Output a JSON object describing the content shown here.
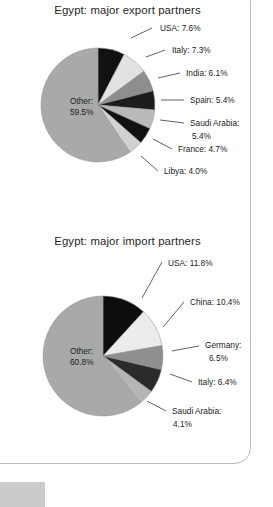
{
  "page": {
    "background_color": "#ffffff",
    "border_color": "#b9bcbe",
    "corner_block_color": "#c9cbcc"
  },
  "chart_data": [
    {
      "id": "export",
      "type": "pie",
      "title": "Egypt: major export partners",
      "xlabel": "",
      "ylabel": "",
      "legend": "callout-labels",
      "grid": false,
      "start_angle_deg": 0,
      "direction": "clockwise",
      "center": {
        "x": 98,
        "y": 105
      },
      "radius": 57,
      "categories": [
        "USA",
        "Italy",
        "India",
        "Spain",
        "Saudi Arabia",
        "France",
        "Libya",
        "Other"
      ],
      "values": [
        7.6,
        7.3,
        6.1,
        5.4,
        5.4,
        4.7,
        4.0,
        59.5
      ],
      "colors": [
        "#111111",
        "#e2e2e0",
        "#8d8f8f",
        "#1c1c1c",
        "#b9bbb9",
        "#111111",
        "#d2d3d1",
        "#a8aaa9"
      ],
      "slices": [
        {
          "label": "USA: 7.6%",
          "name": "USA",
          "value": 7.6,
          "color": "#111111",
          "label_x": 160,
          "label_y": 31,
          "anchor": "start",
          "leader": "M 131,38 L 152,28"
        },
        {
          "label": "Italy: 7.3%",
          "name": "Italy",
          "value": 7.3,
          "color": "#e2e2e0",
          "label_x": 172,
          "label_y": 53,
          "anchor": "start",
          "leader": "M 146,57 L 165,50"
        },
        {
          "label": "India: 6.1%",
          "name": "India",
          "value": 6.1,
          "color": "#8d8f8f",
          "label_x": 186,
          "label_y": 76,
          "anchor": "start",
          "leader": "M 158,78 L 180,73"
        },
        {
          "label": "Spain: 5.4%",
          "name": "Spain",
          "value": 5.4,
          "color": "#1c1c1c",
          "label_x": 190,
          "label_y": 103,
          "anchor": "start",
          "leader": "M 161,100 L 184,100"
        },
        {
          "label": "Saudi Arabia:",
          "name": "Saudi Arabia",
          "value": 5.4,
          "color": "#b9bbb9",
          "label_x": 190,
          "label_y": 126,
          "anchor": "start",
          "label2": "5.4%",
          "label2_x": 192,
          "label2_y": 139,
          "leader": "M 160,120 L 184,123"
        },
        {
          "label": "France: 4.7%",
          "name": "France",
          "value": 4.7,
          "color": "#111111",
          "label_x": 178,
          "label_y": 152,
          "anchor": "start",
          "leader": "M 153,139 L 172,149"
        },
        {
          "label": "Libya: 4.0%",
          "name": "Libya",
          "value": 4.0,
          "color": "#d2d3d1",
          "label_x": 164,
          "label_y": 174,
          "anchor": "start",
          "leader": "M 141,156 L 158,171"
        },
        {
          "label": "Other:",
          "name": "Other",
          "value": 59.5,
          "color": "#a8aaa9",
          "label_x": 70,
          "label_y": 104,
          "anchor": "start",
          "label2": "59.5%",
          "label2_x": 70,
          "label2_y": 115,
          "inner": true
        }
      ]
    },
    {
      "id": "import",
      "type": "pie",
      "title": "Egypt: major import partners",
      "xlabel": "",
      "ylabel": "",
      "legend": "callout-labels",
      "grid": false,
      "start_angle_deg": 0,
      "direction": "clockwise",
      "center": {
        "x": 103,
        "y": 128
      },
      "radius": 60,
      "categories": [
        "USA",
        "China",
        "Germany",
        "Italy",
        "Saudi Arabia",
        "Other"
      ],
      "values": [
        11.8,
        10.4,
        6.5,
        6.4,
        4.1,
        60.8
      ],
      "colors": [
        "#0d0d0d",
        "#ececeb",
        "#8e908f",
        "#2b2b2b",
        "#b4b6b4",
        "#a8aaa9"
      ],
      "slices": [
        {
          "label": "USA: 11.8%",
          "name": "USA",
          "value": 11.8,
          "color": "#0d0d0d",
          "label_x": 168,
          "label_y": 38,
          "anchor": "start",
          "leader": "M 142,70 L 162,34"
        },
        {
          "label": "China: 10.4%",
          "name": "China",
          "value": 10.4,
          "color": "#ececeb",
          "label_x": 190,
          "label_y": 77,
          "anchor": "start",
          "leader": "M 163,99 L 184,74"
        },
        {
          "label": "Germany:",
          "name": "Germany",
          "value": 6.5,
          "color": "#8e908f",
          "label_x": 205,
          "label_y": 120,
          "anchor": "start",
          "label2": "6.5%",
          "label2_x": 209,
          "label2_y": 133,
          "leader": "M 172,123 L 199,118"
        },
        {
          "label": "Italy: 6.4%",
          "name": "Italy",
          "value": 6.4,
          "color": "#2b2b2b",
          "label_x": 198,
          "label_y": 157,
          "anchor": "start",
          "leader": "M 170,146 L 192,154"
        },
        {
          "label": "Saudi Arabia:",
          "name": "Saudi Arabia",
          "value": 4.1,
          "color": "#b4b6b4",
          "label_x": 172,
          "label_y": 186,
          "anchor": "start",
          "label2": "4.1%",
          "label2_x": 173,
          "label2_y": 199,
          "leader": "M 147,173 L 166,183"
        },
        {
          "label": "Other:",
          "name": "Other",
          "value": 60.8,
          "color": "#a8aaa9",
          "label_x": 70,
          "label_y": 126,
          "anchor": "start",
          "label2": "60.8%",
          "label2_x": 70,
          "label2_y": 137,
          "inner": true
        }
      ]
    }
  ]
}
